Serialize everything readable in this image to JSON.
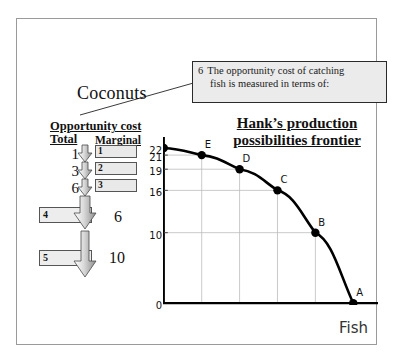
{
  "slide": {
    "coconuts_label": "Coconuts",
    "fish_label": "Fish",
    "chart_title_line1": "Hank’s production",
    "chart_title_line2": "possibilities frontier"
  },
  "callout": {
    "index": "6",
    "line1": "The opportunity cost of catching",
    "line2": "fish is measured in terms of:"
  },
  "table": {
    "heading": "Opportunity cost",
    "total_header": "Total",
    "marginal_header": "Marginal",
    "total_values": [
      "1",
      "3",
      "6"
    ],
    "marginal_values": [
      "1",
      "2",
      "3"
    ],
    "blank_boxes": [
      "4",
      "5"
    ],
    "big_marginals": [
      "6",
      "10"
    ]
  },
  "chart_data": {
    "type": "line",
    "title": "Hank’s production possibilities frontier",
    "xlabel": "Fish",
    "ylabel": "Coconuts",
    "x": [
      0,
      1,
      2,
      3,
      4,
      5
    ],
    "values": [
      22,
      21,
      19,
      16,
      10,
      0
    ],
    "point_labels": [
      "F",
      "E",
      "D",
      "C",
      "B",
      "A"
    ],
    "xticks": [
      "1",
      "2",
      "3",
      "4",
      "5"
    ],
    "yticks": [
      "22",
      "21",
      "19",
      "16",
      "10",
      "0"
    ],
    "xlim": [
      0,
      5.6
    ],
    "ylim": [
      0,
      23
    ],
    "grid": true,
    "legend": "none",
    "marker_color": "#000000",
    "line_color": "#000000",
    "grid_color": "#bdbdbd"
  }
}
